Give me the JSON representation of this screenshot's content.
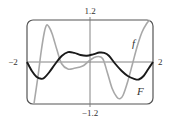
{
  "chart_data": {
    "type": "line",
    "title": "",
    "xlabel": "",
    "ylabel": "",
    "xlim": [
      -2,
      2
    ],
    "ylim": [
      -1.2,
      1.2
    ],
    "grid": false,
    "x_tick_labels": {
      "left": "−2",
      "right": "2"
    },
    "y_tick_labels": {
      "top": "1.2",
      "bottom": "−1.2"
    },
    "series": [
      {
        "name": "f",
        "color": "#a8a8a8",
        "x": [
          -1.78,
          -1.65,
          -1.55,
          -1.45,
          -1.38,
          -1.3,
          -1.2,
          -1.05,
          -0.9,
          -0.7,
          -0.5,
          -0.35,
          -0.2,
          0.0,
          0.2,
          0.4,
          0.55,
          0.7,
          0.85,
          0.95,
          1.05,
          1.2,
          1.35,
          1.5,
          1.65,
          1.8,
          1.9
        ],
        "values": [
          -1.2,
          -0.4,
          0.3,
          0.85,
          1.05,
          1.0,
          0.8,
          0.35,
          -0.05,
          -0.2,
          -0.18,
          -0.15,
          -0.1,
          0.05,
          0.15,
          0.1,
          -0.3,
          -0.75,
          -1.0,
          -1.05,
          -0.95,
          -0.55,
          -0.05,
          0.45,
          0.85,
          1.1,
          1.2
        ]
      },
      {
        "name": "F",
        "color": "#1a1a1a",
        "x": [
          -2.0,
          -1.85,
          -1.7,
          -1.55,
          -1.45,
          -1.3,
          -1.1,
          -0.9,
          -0.7,
          -0.5,
          -0.3,
          -0.1,
          0.1,
          0.3,
          0.45,
          0.6,
          0.8,
          1.0,
          1.2,
          1.4,
          1.55,
          1.7,
          1.85,
          2.0
        ],
        "values": [
          0.0,
          -0.25,
          -0.42,
          -0.48,
          -0.45,
          -0.3,
          -0.05,
          0.17,
          0.28,
          0.26,
          0.2,
          0.18,
          0.22,
          0.27,
          0.26,
          0.18,
          -0.05,
          -0.25,
          -0.4,
          -0.48,
          -0.5,
          -0.4,
          -0.2,
          0.0
        ]
      }
    ],
    "annotations": [
      {
        "text": "f",
        "series": "f"
      },
      {
        "text": "F",
        "series": "F"
      }
    ]
  }
}
